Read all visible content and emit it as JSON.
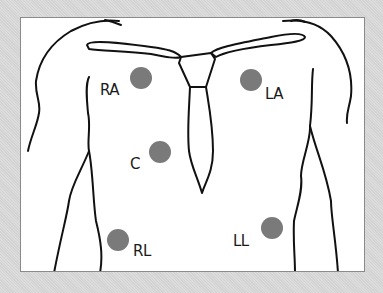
{
  "diagram": {
    "type": "ecg-electrode-placement",
    "colors": {
      "background": "#d9d9d9",
      "panel": "#ffffff",
      "outline": "#111111",
      "electrode": "#7a7a7a"
    },
    "electrodes": [
      {
        "id": "RA",
        "label": "RA",
        "x": 141,
        "y": 78
      },
      {
        "id": "LA",
        "label": "LA",
        "x": 252,
        "y": 79
      },
      {
        "id": "C",
        "label": "C",
        "x": 160,
        "y": 151
      },
      {
        "id": "RL",
        "label": "RL",
        "x": 118,
        "y": 239
      },
      {
        "id": "LL",
        "label": "LL",
        "x": 271,
        "y": 228
      }
    ]
  }
}
